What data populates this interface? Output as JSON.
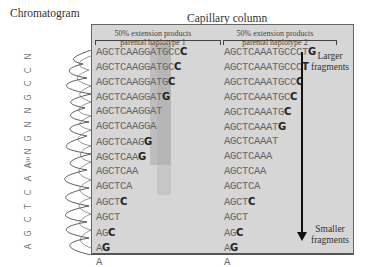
{
  "titles": {
    "chromatogram": "Chromatogram",
    "capillary": "Capillary column"
  },
  "headers": {
    "haplotype1": "50% extension products parental haplotype 1",
    "haplotype1_line1": "50% extension products",
    "haplotype1_line2": "parental haplotype 1",
    "haplotype2_line1": "50% extension products",
    "haplotype2_line2": "parental haplotype 2"
  },
  "labels": {
    "larger_line1": "Larger",
    "larger_line2": "fragments",
    "smaller_line1": "Smaller",
    "smaller_line2": "fragments",
    "position_marker": "330"
  },
  "chromatogram_bases_top_to_bottom": [
    "N",
    "C",
    "C",
    "G",
    "N",
    "N",
    "G",
    "N",
    "A",
    "A",
    "C",
    "T",
    "C",
    "G",
    "A"
  ],
  "haplotype1": {
    "rows": [
      {
        "prefix": "AGCTCAAGGATGCC",
        "last": "C"
      },
      {
        "prefix": "AGCTCAAGGATGC",
        "last": "C"
      },
      {
        "prefix": "AGCTCAAGGATG",
        "last": "C"
      },
      {
        "prefix": "AGCTCAAGGAT",
        "last": "G"
      },
      {
        "prefix": "AGCTCAAGGA",
        "last": "T"
      },
      {
        "prefix": "AGCTCAAGG",
        "last": "A"
      },
      {
        "prefix": "AGCTCAAG",
        "last": "G"
      },
      {
        "prefix": "AGCTCAA",
        "last": "G"
      },
      {
        "prefix": "AGCTCA",
        "last": "A"
      },
      {
        "prefix": "AGCTC",
        "last": "A"
      },
      {
        "prefix": "AGCT",
        "last": "C"
      },
      {
        "prefix": "AGC",
        "last": "T"
      },
      {
        "prefix": "AG",
        "last": "C"
      },
      {
        "prefix": "A",
        "last": "G"
      },
      {
        "prefix": "",
        "last": "A"
      }
    ]
  },
  "haplotype2": {
    "rows": [
      {
        "prefix": "AGCTCAAATGCCCT",
        "last": "G"
      },
      {
        "prefix": "AGCTCAAATGCCC",
        "last": "T"
      },
      {
        "prefix": "AGCTCAAATGCC",
        "last": "C"
      },
      {
        "prefix": "AGCTCAAATGC",
        "last": "C"
      },
      {
        "prefix": "AGCTCAAATG",
        "last": "C"
      },
      {
        "prefix": "AGCTCAAAT",
        "last": "G"
      },
      {
        "prefix": "AGCTCAAA",
        "last": "T"
      },
      {
        "prefix": "AGCTCAA",
        "last": "A"
      },
      {
        "prefix": "AGCTCA",
        "last": "A"
      },
      {
        "prefix": "AGCTC",
        "last": "A"
      },
      {
        "prefix": "AGCT",
        "last": "C"
      },
      {
        "prefix": "AGC",
        "last": "T"
      },
      {
        "prefix": "AG",
        "last": "C"
      },
      {
        "prefix": "A",
        "last": "G"
      },
      {
        "prefix": "",
        "last": "A"
      }
    ]
  },
  "colors": {
    "panel": "#d6d6d6",
    "highlight": "#a9a9a9",
    "text": "#666666",
    "bold_base": "#222222"
  }
}
